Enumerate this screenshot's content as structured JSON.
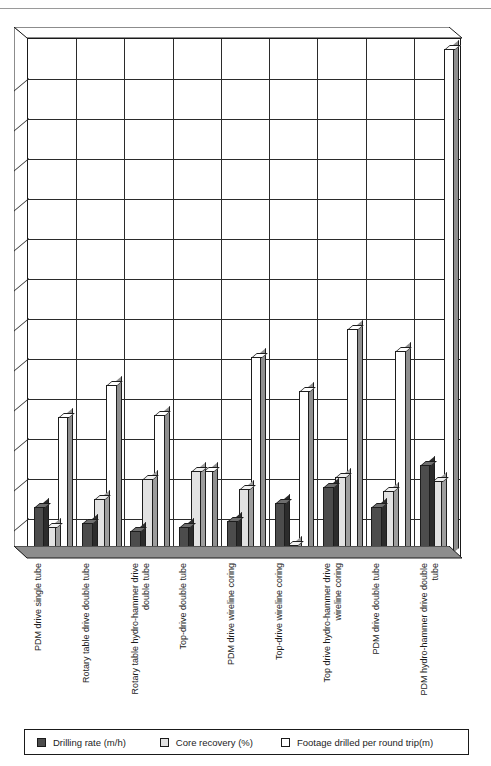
{
  "top_strip": {
    "clipped_text": ""
  },
  "legend": {
    "position": "bottom",
    "items": [
      {
        "label": "Drilling rate (m/h)",
        "swatch": "dark-gray-swatch",
        "color": "#4c4c4c"
      },
      {
        "label": "Core recovery (%)",
        "swatch": "light-gray-swatch",
        "color": "#e2e2e2"
      },
      {
        "label": "Footage drilled per round trip(m)",
        "swatch": "white-swatch",
        "color": "#ffffff"
      }
    ]
  },
  "axis": {
    "gridlines": 12,
    "grid_visible": true,
    "tick_count": 12,
    "ymin": 0,
    "ymax": 130,
    "tick_step": 10,
    "labels_visible": false
  },
  "chart_data": {
    "type": "bar",
    "title": "",
    "subtitle": "",
    "xlabel": "",
    "ylabel": "",
    "ylim": [
      0,
      130
    ],
    "grid": true,
    "legend_position": "bottom",
    "style": "3d-grouped-column",
    "categories": [
      "PDM drive single tube",
      "Rotary table drive double tube",
      "Rotary table hydro-hammer drive double tube",
      "Top-drive double tube",
      "PDM drive wireline coring",
      "Top-drive wireline coring",
      "Top drive hydro-hammer drive wireline coring",
      "PDM drive double tube",
      "PDM hydro-hammer drive double tube"
    ],
    "series": [
      {
        "name": "Drilling rate (m/h)",
        "color": "#4c4c4c",
        "values": [
          12.5,
          8.5,
          6.5,
          7.5,
          9.0,
          13.5,
          17.5,
          12.5,
          23.0
        ]
      },
      {
        "name": "Core recovery (%)",
        "color": "#e2e2e2",
        "values": [
          7.5,
          14.5,
          19.5,
          21.5,
          17.0,
          3.0,
          20.0,
          16.5,
          19.0
        ]
      },
      {
        "name": "Footage drilled per round trip(m)",
        "color": "#ffffff",
        "values": [
          35.0,
          43.0,
          35.5,
          21.5,
          50.0,
          41.5,
          57.0,
          51.5,
          127.0
        ]
      }
    ]
  }
}
